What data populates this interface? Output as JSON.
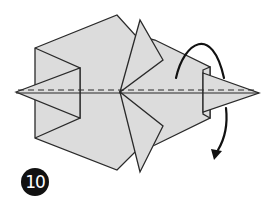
{
  "diagram": {
    "type": "origami-step",
    "step_number": "10",
    "colors": {
      "paper": "#dcdcdc",
      "outline": "#2a2a2a",
      "badge_bg": "#111111",
      "badge_text": "#ffffff"
    },
    "elements": [
      "folded-model-body",
      "valley-fold-line-dashed",
      "turn-over-arrow"
    ]
  }
}
